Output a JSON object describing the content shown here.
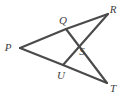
{
  "figure": {
    "kind": "geometry-diagram",
    "width": 124,
    "height": 97,
    "background_color": "#ffffff",
    "stroke_color": "#4a4a4a",
    "label_color": "#3d3d3d",
    "points": [
      {
        "id": "P",
        "label": "P",
        "x": 20,
        "y": 48,
        "label_x": 8,
        "label_y": 47
      },
      {
        "id": "Q",
        "label": "Q",
        "x": 66,
        "y": 29,
        "label_x": 63,
        "label_y": 20
      },
      {
        "id": "R",
        "label": "R",
        "x": 108,
        "y": 14,
        "label_x": 113,
        "label_y": 9
      },
      {
        "id": "S",
        "label": "S",
        "x": 74,
        "y": 49,
        "label_x": 82,
        "label_y": 51
      },
      {
        "id": "U",
        "label": "U",
        "x": 63,
        "y": 65,
        "label_x": 61,
        "label_y": 75
      },
      {
        "id": "T",
        "label": "T",
        "x": 107,
        "y": 83,
        "label_x": 113,
        "label_y": 88
      }
    ],
    "segments": [
      {
        "id": "PQ",
        "from": "P",
        "to": "Q",
        "name": "segment-p-q"
      },
      {
        "id": "PU",
        "from": "P",
        "to": "U",
        "name": "segment-p-u"
      },
      {
        "id": "QR",
        "from": "Q",
        "to": "R",
        "name": "segment-q-r"
      },
      {
        "id": "UT",
        "from": "U",
        "to": "T",
        "name": "segment-u-t"
      },
      {
        "id": "QT",
        "from": "Q",
        "to": "T",
        "name": "segment-q-t"
      },
      {
        "id": "UR",
        "from": "U",
        "to": "R",
        "name": "segment-u-r"
      }
    ]
  }
}
